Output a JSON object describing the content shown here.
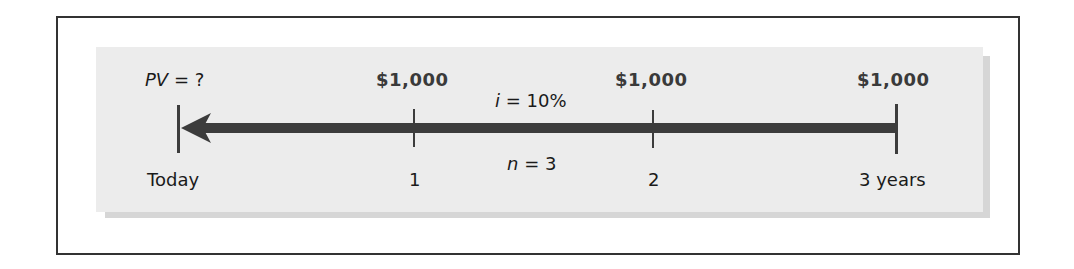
{
  "diagram": {
    "type": "timeline",
    "direction": "right-to-left discounting arrow",
    "colors": {
      "frame_border": "#333333",
      "panel_background": "#ececec",
      "panel_shadow": "#d6d6d6",
      "arrow": "#3c3c3c",
      "text": "#1a1a1a",
      "amount_text": "#3a3a3a"
    },
    "present_value": {
      "variable": "PV",
      "rest": " = ?"
    },
    "rate": {
      "variable": "i",
      "rest": " = 10%"
    },
    "periods": {
      "variable": "n",
      "rest": " = 3"
    },
    "points": [
      {
        "label": "Today",
        "cashflow": ""
      },
      {
        "label": "1",
        "cashflow": "$1,000"
      },
      {
        "label": "2",
        "cashflow": "$1,000"
      },
      {
        "label": "3 years",
        "cashflow": "$1,000"
      }
    ]
  }
}
